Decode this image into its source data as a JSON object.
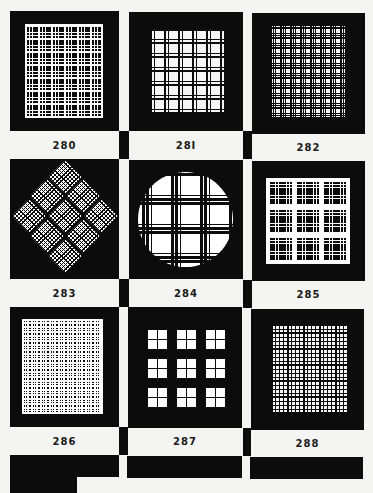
{
  "page": {
    "background": "#f4f4f2",
    "ink": "#0c0c0c"
  },
  "swatches": [
    {
      "number": "280",
      "shape": "square",
      "style": "white lines on black, thick-thin-thin groups"
    },
    {
      "number": "28I",
      "shape": "square",
      "style": "black lines on white"
    },
    {
      "number": "282",
      "shape": "square",
      "style": "dense black lines on white"
    },
    {
      "number": "283",
      "shape": "diamond",
      "style": "3x3 rotated plaid tiles"
    },
    {
      "number": "284",
      "shape": "circle",
      "style": "broken black bars on white disc"
    },
    {
      "number": "285",
      "shape": "square",
      "style": "3x3 plaid blocks on white"
    },
    {
      "number": "286",
      "shape": "square",
      "style": "dense white lines on black"
    },
    {
      "number": "287",
      "shape": "square",
      "style": "3x3 windows with dashed frames"
    },
    {
      "number": "288",
      "shape": "square",
      "style": "fine black grid on white"
    }
  ]
}
